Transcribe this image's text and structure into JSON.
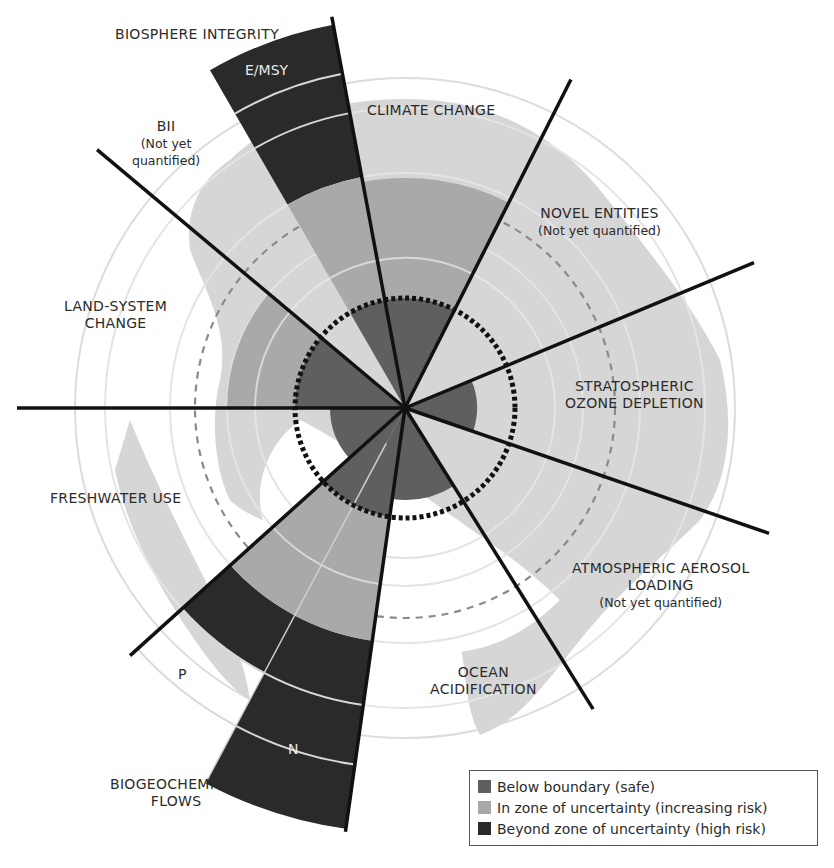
{
  "chart_data": {
    "type": "polar-area",
    "center": [
      405,
      408
    ],
    "rings": {
      "boundary_radius": 110,
      "dashed_radius": 210,
      "globe_radius": 330
    },
    "sectors": [
      {
        "name": "CLIMATE CHANGE",
        "start": -10.6,
        "end": 26.8,
        "safe": 110,
        "uncertain": 230,
        "high": 0
      },
      {
        "name": "NOVEL ENTITIES",
        "start": 26.8,
        "end": 67.4,
        "safe": 0,
        "uncertain": 0,
        "high": 0,
        "note": "Not yet quantified"
      },
      {
        "name": "STRATOSPHERIC OZONE DEPLETION",
        "start": 67.4,
        "end": 109,
        "safe": 72,
        "uncertain": 0,
        "high": 0
      },
      {
        "name": "ATMOSPHERIC AEROSOL LOADING",
        "start": 109,
        "end": 148,
        "safe": 0,
        "uncertain": 0,
        "high": 0,
        "note": "Not yet quantified"
      },
      {
        "name": "OCEAN ACIDIFICATION",
        "start": 148,
        "end": 188,
        "safe": 92,
        "uncertain": 0,
        "high": 0
      },
      {
        "name": "BIOGEOCHEMICAL FLOWS: N",
        "start": 188,
        "end": 208,
        "safe": 110,
        "uncertain": 235,
        "high": 425
      },
      {
        "name": "BIOGEOCHEMICAL FLOWS: P",
        "start": 208,
        "end": 228,
        "safe": 110,
        "uncertain": 235,
        "high": 300
      },
      {
        "name": "FRESHWATER USE",
        "start": 228,
        "end": 270,
        "safe": 75,
        "uncertain": 0,
        "high": 0
      },
      {
        "name": "LAND-SYSTEM CHANGE",
        "start": 270,
        "end": 310,
        "safe": 110,
        "uncertain": 178,
        "high": 0
      },
      {
        "name": "BIOSPHERE INTEGRITY: BII",
        "start": 310,
        "end": 330,
        "safe": 0,
        "uncertain": 0,
        "high": 0,
        "note": "Not yet quantified"
      },
      {
        "name": "BIOSPHERE INTEGRITY: E/MSY",
        "start": 330,
        "end": 349.4,
        "safe": 110,
        "uncertain": 235,
        "high": 390
      }
    ],
    "divider_angles": [
      -10.6,
      26.8,
      67.4,
      109,
      148,
      188,
      228,
      270,
      310
    ],
    "legend": [
      {
        "label": "Below boundary (safe)",
        "color": "#5f5f5f"
      },
      {
        "label": "In zone of uncertainty (increasing risk)",
        "color": "#a9a9a9"
      },
      {
        "label": "Beyond zone of uncertainty (high risk)",
        "color": "#2a2a2a"
      }
    ]
  },
  "labels": {
    "biosphere": "BIOSPHERE INTEGRITY",
    "emsy": "E/MSY",
    "bii": "BII",
    "bii_note": "(Not yet",
    "bii_note2": "quantified)",
    "climate": "CLIMATE CHANGE",
    "novel": "NOVEL ENTITIES",
    "novel_note": "(Not yet quantified)",
    "land1": "LAND-SYSTEM",
    "land2": "CHANGE",
    "ozone1": "STRATOSPHERIC",
    "ozone2": "OZONE DEPLETION",
    "freshwater": "FRESHWATER USE",
    "aerosol1": "ATMOSPHERIC AEROSOL",
    "aerosol2": "LOADING",
    "aerosol_note": "(Not yet quantified)",
    "p": "P",
    "ocean1": "OCEAN",
    "ocean2": "ACIDIFICATION",
    "n": "N",
    "bgc1": "BIOGEOCHEMICAL",
    "bgc2": "FLOWS"
  },
  "legend": {
    "safe": "Below boundary (safe)",
    "uncertain": "In zone of uncertainty (increasing risk)",
    "high": "Beyond zone of uncertainty (high risk)"
  },
  "colors": {
    "safe": "#5f5f5f",
    "uncertain": "#a9a9a9",
    "high": "#2a2a2a",
    "land": "#d6d6d6",
    "ring": "#dcdcdc",
    "dashed": "#8a8a8a",
    "divider": "#111111"
  }
}
